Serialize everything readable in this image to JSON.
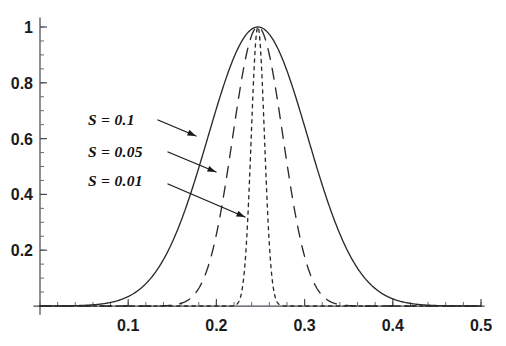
{
  "figure": {
    "kind": "line-plot",
    "background_color": "#ffffff",
    "ink_color": "#2b2b2b"
  },
  "chart_data": {
    "type": "line",
    "title": "",
    "subtitle": "",
    "xlabel": "",
    "ylabel": "",
    "xlim": [
      0,
      0.5
    ],
    "ylim": [
      0,
      1.05
    ],
    "grid": false,
    "legend_position": "inline-annotations",
    "x_ticks": [
      0.1,
      0.2,
      0.3,
      0.4,
      0.5
    ],
    "x_tick_labels": [
      "0.1",
      "0.2",
      "0.3",
      "0.4",
      "0.5"
    ],
    "x_minor_tick_step": 0.02,
    "y_ticks": [
      0.2,
      0.4,
      0.6,
      0.8,
      1
    ],
    "y_tick_labels": [
      "0.2",
      "0.4",
      "0.6",
      "0.8",
      "1"
    ],
    "y_minor_tick_step": 0.05,
    "peak_x": 0.247,
    "peak_y": 1,
    "series": [
      {
        "name": "S = 0.1",
        "label": "S = 0.1",
        "param_S": 0.1,
        "style": "solid",
        "sigma": 0.0565,
        "center": 0.247,
        "amplitude": 1,
        "x": [
          0.0,
          0.02,
          0.04,
          0.06,
          0.08,
          0.1,
          0.12,
          0.14,
          0.16,
          0.18,
          0.2,
          0.22,
          0.247,
          0.27,
          0.29,
          0.31,
          0.33,
          0.35,
          0.37,
          0.39,
          0.41,
          0.43,
          0.45,
          0.47,
          0.5
        ],
        "y": [
          0.007,
          0.015,
          0.031,
          0.059,
          0.105,
          0.173,
          0.267,
          0.383,
          0.512,
          0.64,
          0.76,
          0.902,
          1.0,
          0.93,
          0.81,
          0.66,
          0.5,
          0.36,
          0.24,
          0.15,
          0.087,
          0.047,
          0.024,
          0.012,
          0.004
        ]
      },
      {
        "name": "S = 0.05",
        "label": "S = 0.05",
        "param_S": 0.05,
        "style": "dashed",
        "sigma": 0.0285,
        "center": 0.247,
        "amplitude": 1,
        "x": [
          0.14,
          0.16,
          0.18,
          0.2,
          0.21,
          0.22,
          0.23,
          0.247,
          0.26,
          0.27,
          0.28,
          0.29,
          0.3,
          0.31,
          0.32,
          0.33,
          0.345,
          0.36
        ],
        "y": [
          0.011,
          0.04,
          0.11,
          0.25,
          0.35,
          0.5,
          0.65,
          1.0,
          0.9,
          0.78,
          0.63,
          0.47,
          0.33,
          0.2,
          0.12,
          0.06,
          0.02,
          0.006
        ]
      },
      {
        "name": "S = 0.01",
        "label": "S = 0.01",
        "param_S": 0.01,
        "style": "dotted",
        "sigma": 0.0075,
        "center": 0.247,
        "amplitude": 1,
        "x": [
          0.225,
          0.232,
          0.236,
          0.24,
          0.243,
          0.247,
          0.251,
          0.254,
          0.258,
          0.262,
          0.268,
          0.275
        ],
        "y": [
          0.005,
          0.1,
          0.3,
          0.62,
          0.88,
          1.0,
          0.88,
          0.64,
          0.33,
          0.12,
          0.02,
          0.004
        ]
      }
    ]
  },
  "annotations": [
    {
      "id": "annot-s-01",
      "text": "S = 0.1",
      "label_x": 88,
      "label_y": 125,
      "leader_from_x": 158,
      "leader_from_y": 120,
      "leader_to_x": 196,
      "leader_to_y": 136,
      "target_series": "S = 0.1"
    },
    {
      "id": "annot-s-005",
      "text": "S = 0.05",
      "label_x": 88,
      "label_y": 157,
      "leader_from_x": 168,
      "leader_from_y": 152,
      "leader_to_x": 216,
      "leader_to_y": 172,
      "target_series": "S = 0.05"
    },
    {
      "id": "annot-s-001",
      "text": "S = 0.01",
      "label_x": 88,
      "label_y": 186,
      "leader_from_x": 168,
      "leader_from_y": 184,
      "leader_to_x": 245,
      "leader_to_y": 217,
      "target_series": "S = 0.01"
    }
  ]
}
